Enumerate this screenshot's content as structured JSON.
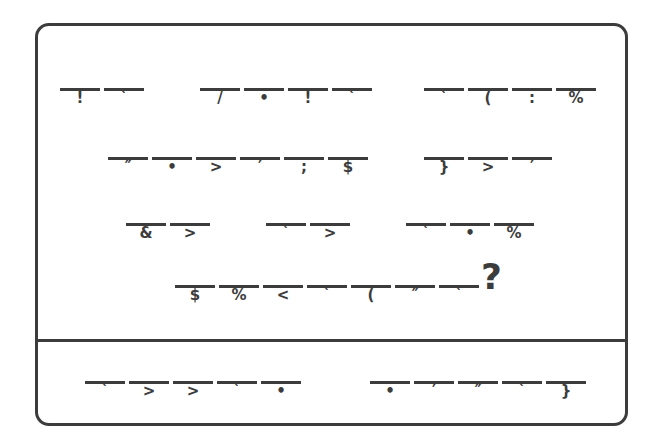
{
  "document": {
    "type": "cryptogram-worksheet",
    "frame_color": "#3c3c3c",
    "background_color": "#ffffff",
    "ink_color": "#3c3c3c",
    "sections": 2
  },
  "puzzle": {
    "trailing_punctuation": "?",
    "rows": [
      {
        "id": "row-1",
        "top": 88,
        "groups": [
          {
            "id": "row-1-group-1",
            "left": 60,
            "blanks": [
              {
                "glyph": "!"
              },
              {
                "glyph": "`"
              }
            ]
          },
          {
            "id": "row-1-group-2",
            "left": 200,
            "blanks": [
              {
                "glyph": "/"
              },
              {
                "glyph": "•"
              },
              {
                "glyph": "!"
              },
              {
                "glyph": "`"
              }
            ]
          },
          {
            "id": "row-1-group-3",
            "left": 424,
            "blanks": [
              {
                "glyph": "`"
              },
              {
                "glyph": "("
              },
              {
                "glyph": ":"
              },
              {
                "glyph": "%"
              }
            ]
          }
        ]
      },
      {
        "id": "row-2",
        "top": 157,
        "groups": [
          {
            "id": "row-2-group-1",
            "left": 108,
            "blanks": [
              {
                "glyph": "″"
              },
              {
                "glyph": "•"
              },
              {
                "glyph": ">"
              },
              {
                "glyph": "′"
              },
              {
                "glyph": ";"
              },
              {
                "glyph": "$"
              }
            ]
          },
          {
            "id": "row-2-group-2",
            "left": 424,
            "blanks": [
              {
                "glyph": "}"
              },
              {
                "glyph": ">"
              },
              {
                "glyph": "′"
              }
            ]
          }
        ]
      },
      {
        "id": "row-3",
        "top": 223,
        "groups": [
          {
            "id": "row-3-group-1",
            "left": 126,
            "blanks": [
              {
                "glyph": "&"
              },
              {
                "glyph": ">"
              }
            ]
          },
          {
            "id": "row-3-group-2",
            "left": 266,
            "blanks": [
              {
                "glyph": "`"
              },
              {
                "glyph": ">"
              }
            ]
          },
          {
            "id": "row-3-group-3",
            "left": 406,
            "blanks": [
              {
                "glyph": "`"
              },
              {
                "glyph": "•"
              },
              {
                "glyph": "%"
              }
            ]
          }
        ]
      },
      {
        "id": "row-4",
        "top": 285,
        "groups": [
          {
            "id": "row-4-group-1",
            "left": 175,
            "blanks": [
              {
                "glyph": "$"
              },
              {
                "glyph": "%"
              },
              {
                "glyph": "<"
              },
              {
                "glyph": "`"
              },
              {
                "glyph": "("
              },
              {
                "glyph": "″"
              },
              {
                "glyph": "`"
              }
            ]
          }
        ]
      }
    ]
  },
  "answer_area": {
    "id": "answer-row",
    "rows": [
      {
        "id": "row-5",
        "top": 381,
        "groups": [
          {
            "id": "row-5-group-1",
            "left": 85,
            "blanks": [
              {
                "glyph": "`"
              },
              {
                "glyph": ">"
              },
              {
                "glyph": ">"
              },
              {
                "glyph": "`"
              },
              {
                "glyph": "•"
              }
            ]
          },
          {
            "id": "row-5-group-2",
            "left": 370,
            "blanks": [
              {
                "glyph": "•"
              },
              {
                "glyph": "′"
              },
              {
                "glyph": "″"
              },
              {
                "glyph": "`"
              },
              {
                "glyph": "}"
              }
            ]
          }
        ]
      }
    ]
  }
}
